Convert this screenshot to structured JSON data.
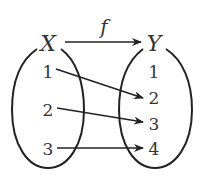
{
  "diagram": {
    "function_label": "f",
    "domain": {
      "label": "X",
      "elements": [
        "1",
        "2",
        "3"
      ]
    },
    "codomain": {
      "label": "Y",
      "elements": [
        "1",
        "2",
        "3",
        "4"
      ]
    },
    "mappings": [
      {
        "from": "1",
        "to": "2"
      },
      {
        "from": "2",
        "to": "3"
      },
      {
        "from": "3",
        "to": "4"
      }
    ],
    "colors": {
      "stroke": "#222222",
      "text": "#333333"
    }
  }
}
